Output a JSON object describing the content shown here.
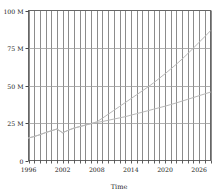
{
  "chart_data": {
    "type": "line",
    "title": "",
    "xlabel": "Time",
    "ylabel": "",
    "xlim": [
      1996,
      2028
    ],
    "ylim": [
      0,
      100
    ],
    "grid": true,
    "legend": "none",
    "y_tick_labels": [
      "100 M",
      "75 M",
      "50 M",
      "25 M",
      "0"
    ],
    "y_tick_values": [
      100,
      75,
      50,
      25,
      0
    ],
    "x_tick_labels": [
      "1996",
      "2002",
      "2008",
      "2014",
      "2020",
      "2026"
    ],
    "x_tick_values": [
      1996,
      2002,
      2008,
      2014,
      2020,
      2026
    ],
    "x_minor_gridlines": [
      1996,
      1997,
      1998,
      1999,
      2000,
      2001,
      2002,
      2003,
      2004,
      2005,
      2006,
      2007,
      2008,
      2009,
      2010,
      2011,
      2012,
      2013,
      2014,
      2015,
      2016,
      2017,
      2018,
      2019,
      2020,
      2021,
      2022,
      2023,
      2024,
      2025,
      2026,
      2027,
      2028
    ],
    "series": [
      {
        "name": "upper-series",
        "color": "#b8b8b8",
        "x": [
          1996,
          1997,
          1998,
          1999,
          2000,
          2001,
          2002,
          2003,
          2004,
          2005,
          2006,
          2007,
          2008,
          2009,
          2010,
          2011,
          2012,
          2013,
          2014,
          2015,
          2016,
          2017,
          2018,
          2019,
          2020,
          2021,
          2022,
          2023,
          2024,
          2025,
          2026,
          2027,
          2028
        ],
        "y": [
          15.0,
          16.0,
          17.2,
          18.6,
          19.8,
          21.0,
          18.5,
          20.2,
          21.6,
          22.6,
          23.6,
          24.6,
          25.8,
          28.2,
          30.8,
          33.4,
          36.0,
          38.6,
          41.2,
          43.8,
          46.4,
          49.0,
          51.8,
          54.8,
          57.8,
          61.0,
          64.2,
          67.6,
          71.2,
          75.0,
          78.8,
          82.6,
          86.5
        ]
      },
      {
        "name": "lower-series",
        "color": "#b8b8b8",
        "x": [
          1996,
          1997,
          1998,
          1999,
          2000,
          2001,
          2002,
          2003,
          2004,
          2005,
          2006,
          2007,
          2008,
          2009,
          2010,
          2011,
          2012,
          2013,
          2014,
          2015,
          2016,
          2017,
          2018,
          2019,
          2020,
          2021,
          2022,
          2023,
          2024,
          2025,
          2026,
          2027,
          2028
        ],
        "y": [
          15.0,
          16.0,
          17.2,
          18.6,
          19.8,
          21.0,
          18.5,
          20.2,
          21.6,
          22.6,
          23.6,
          24.6,
          25.4,
          26.0,
          26.8,
          27.6,
          28.4,
          29.2,
          30.2,
          31.2,
          32.2,
          33.2,
          34.2,
          35.2,
          36.2,
          37.3,
          38.4,
          39.6,
          40.8,
          42.0,
          43.2,
          44.4,
          45.6
        ]
      }
    ]
  }
}
